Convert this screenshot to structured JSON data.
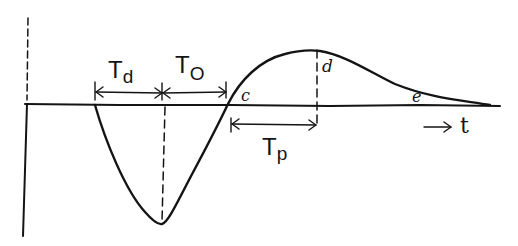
{
  "diagram": {
    "labels": {
      "delay_time": {
        "main": "T",
        "sub": "d"
      },
      "onset_time": {
        "main": "T",
        "sub": "O"
      },
      "peak_time": {
        "main": "T",
        "sub": "p"
      },
      "point_c": "c",
      "point_d": "d",
      "point_e": "e",
      "time_axis": "t"
    },
    "colors": {
      "ink": "#141414",
      "background": "#ffffff"
    }
  }
}
